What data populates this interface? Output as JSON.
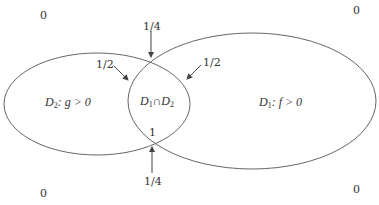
{
  "diagram": {
    "type": "venn-two-regions",
    "colors": {
      "stroke": "#555555",
      "text": "#333333",
      "background": "#ffffff"
    },
    "regions": {
      "d2": {
        "name": "D",
        "sub": "2",
        "rest": ": g > 0",
        "full": "D2: g>0"
      },
      "d1": {
        "name": "D",
        "sub": "1",
        "rest": ": f > 0",
        "full": "D1: f>0"
      },
      "intersection": {
        "a": "D",
        "a_sub": "1",
        "op": "∩",
        "b": "D",
        "b_sub": "2",
        "full": "D1 ∩ D2"
      }
    },
    "corner_values": {
      "top_left": "0",
      "top_right": "0",
      "bottom_left": "0",
      "bottom_right": "0"
    },
    "annotations": {
      "top_intersection": "1/4",
      "bottom_intersection": "1/4",
      "left_boundary": "1/2",
      "right_boundary": "1/2",
      "interior": "1"
    }
  }
}
